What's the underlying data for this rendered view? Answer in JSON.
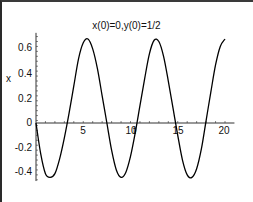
{
  "chart_data": {
    "type": "line",
    "title": "x(0)=0,y(0)=1/2",
    "xlabel": "t",
    "ylabel": "x",
    "xlim": [
      0,
      20
    ],
    "ylim": [
      -0.45,
      0.7
    ],
    "grid": false,
    "legend": null,
    "x_ticks": [
      "5",
      "10",
      "15",
      "20"
    ],
    "x_tick_values": [
      5,
      10,
      15,
      20
    ],
    "y_ticks": [
      "0.6",
      "0.4",
      "0.2",
      "0",
      "-0.2",
      "-0.4"
    ],
    "y_tick_values": [
      0.6,
      0.4,
      0.2,
      0,
      -0.2,
      -0.4
    ],
    "series": [
      {
        "name": "x(t)",
        "color": "#000000",
        "x": [
          0,
          0.5,
          1,
          1.5,
          2,
          2.5,
          3,
          3.5,
          4,
          4.5,
          5,
          5.5,
          6,
          6.5,
          7,
          7.5,
          8,
          8.5,
          9,
          9.5,
          10,
          10.5,
          11,
          11.5,
          12,
          12.5,
          13,
          13.5,
          14,
          14.5,
          15,
          15.5,
          16,
          16.5,
          17,
          17.5,
          18,
          18.5,
          19,
          19.5,
          20
        ],
        "values": [
          0.0,
          -0.25,
          -0.41,
          -0.44,
          -0.41,
          -0.29,
          -0.12,
          0.08,
          0.3,
          0.52,
          0.65,
          0.68,
          0.6,
          0.44,
          0.22,
          0.0,
          -0.22,
          -0.38,
          -0.44,
          -0.4,
          -0.27,
          -0.08,
          0.14,
          0.36,
          0.56,
          0.67,
          0.66,
          0.54,
          0.34,
          0.12,
          -0.1,
          -0.3,
          -0.42,
          -0.44,
          -0.37,
          -0.21,
          0.02,
          0.25,
          0.47,
          0.62,
          0.68
        ]
      }
    ]
  },
  "labels": {
    "title": "x(0)=0,y(0)=1/2",
    "xlabel": "t",
    "ylabel": "x",
    "ytick_0": "0.6",
    "ytick_1": "0.4",
    "ytick_2": "0.2",
    "ytick_3": "0",
    "ytick_4": "-0.2",
    "ytick_5": "-0.4",
    "xtick_0": "5",
    "xtick_1": "10",
    "xtick_2": "15",
    "xtick_3": "20"
  }
}
